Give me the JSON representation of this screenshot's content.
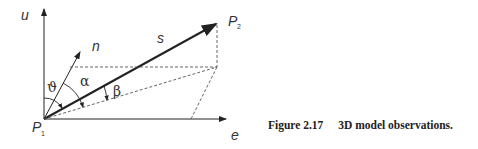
{
  "figure": {
    "caption_label": "Figure 2.17",
    "caption_text": "3D model observations.",
    "labels": {
      "u_axis": "u",
      "e_axis": "e",
      "n_vector": "n",
      "s_vector": "s",
      "p1": "P",
      "p1_sub": "1",
      "p2": "P",
      "p2_sub": "2",
      "theta": "ϑ",
      "alpha": "α",
      "beta": "β"
    },
    "colors": {
      "line": "#222222",
      "dashed": "#555555"
    }
  }
}
